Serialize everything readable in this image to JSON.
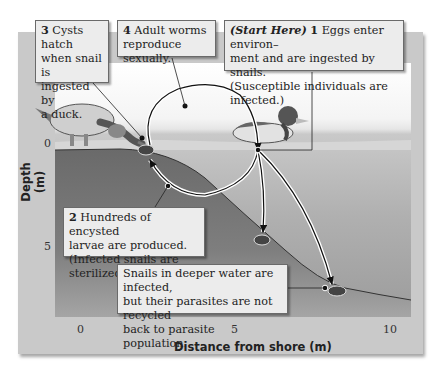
{
  "figure": {
    "type": "parasite life cycle diagram",
    "callouts": {
      "step3": {
        "number": "3",
        "text_lines": [
          "Cysts hatch",
          "when snail is",
          "ingested by",
          "a duck."
        ]
      },
      "step4": {
        "number": "4",
        "text_lines": [
          "Adult worms",
          "reproduce sexually."
        ]
      },
      "step1": {
        "start": "(Start Here)",
        "number": "1",
        "text_lines": [
          "Eggs enter environ–",
          "ment and are ingested by snails.",
          "(Susceptible individuals are infected.)"
        ]
      },
      "step2": {
        "number": "2",
        "text_lines": [
          "Hundreds of encysted",
          "larvae are produced.",
          "(Infected snails are sterilized.)"
        ]
      },
      "deep": {
        "text_lines": [
          "Snails in deeper water are infected,",
          "but their parasites are not recycled",
          "back to parasite population."
        ]
      }
    },
    "axes": {
      "y_label": "Depth (m)",
      "y_ticks": [
        "0",
        "5"
      ],
      "x_label": "Distance from shore (m)",
      "x_ticks": [
        "0",
        "5",
        "10"
      ]
    },
    "colors": {
      "panel": "#c9c9c9",
      "callout_bg": "#ececec",
      "sediment": "#6e6e6e",
      "water": "#bdbdbd",
      "arrow": "#111111"
    }
  }
}
